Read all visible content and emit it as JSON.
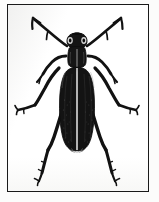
{
  "figure": {
    "domain": "Natural-Image",
    "kind": "line-and-stipple-engraving",
    "subject_label": "beetle",
    "subject_common_name": "blister beetle",
    "subject_order": "Coleoptera",
    "orientation": "dorsal view, head up",
    "frame": {
      "shape": "rectangle",
      "stroke_color": "#1a1a1a",
      "stroke_width_px": 1.6,
      "x": 7,
      "y": 4,
      "width": 142,
      "height": 188
    },
    "palette": {
      "background": "#fcfcfb",
      "plate_background": "#ffffff",
      "ink": "#111111",
      "ink_soft": "#2a2a2a",
      "paper_tint": "#f2f2f0"
    },
    "parts": [
      {
        "name": "left-antenna",
        "label": "Left antenna",
        "count": 1
      },
      {
        "name": "right-antenna",
        "label": "Right antenna",
        "count": 1
      },
      {
        "name": "head",
        "label": "Head",
        "count": 1
      },
      {
        "name": "compound-eyes",
        "label": "Compound eyes",
        "count": 2
      },
      {
        "name": "pronotum",
        "label": "Pronotum",
        "count": 1
      },
      {
        "name": "scutellum",
        "label": "Scutellum",
        "count": 1
      },
      {
        "name": "elytra",
        "label": "Elytra (wing covers)",
        "count": 2
      },
      {
        "name": "elytral-suture",
        "label": "Elytral suture",
        "count": 1
      },
      {
        "name": "abdomen-tip",
        "label": "Abdomen tip",
        "count": 1
      },
      {
        "name": "foreleg-left",
        "label": "Left foreleg",
        "count": 1
      },
      {
        "name": "foreleg-right",
        "label": "Right foreleg",
        "count": 1
      },
      {
        "name": "midleg-left",
        "label": "Left midleg",
        "count": 1
      },
      {
        "name": "midleg-right",
        "label": "Right midleg",
        "count": 1
      },
      {
        "name": "hindleg-left",
        "label": "Left hindleg",
        "count": 1
      },
      {
        "name": "hindleg-right",
        "label": "Right hindleg",
        "count": 1
      }
    ],
    "caption": ""
  }
}
